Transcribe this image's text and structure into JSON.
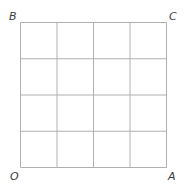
{
  "diagram": {
    "type": "square-grid",
    "rows": 4,
    "cols": 4,
    "line_color": "#b0b0b0",
    "vertices": {
      "top_left": "B",
      "top_right": "C",
      "bottom_left": "O",
      "bottom_right": "A"
    }
  }
}
